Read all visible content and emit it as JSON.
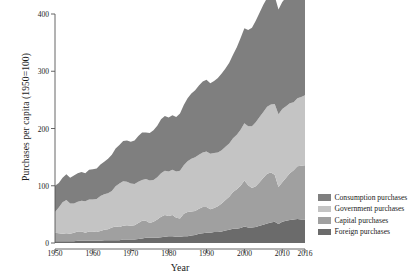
{
  "chart_data": {
    "type": "area",
    "stacked": true,
    "title": "",
    "xlabel": "Year",
    "ylabel": "Purchases per capita (1950=100)",
    "xlim": [
      1950,
      2016
    ],
    "ylim": [
      0,
      400
    ],
    "xticks": [
      1950,
      1960,
      1970,
      1980,
      1990,
      2000,
      2010,
      2016
    ],
    "yticks": [
      0,
      100,
      200,
      300,
      400
    ],
    "grid": false,
    "legend_position": "right",
    "colors": {
      "consumption": "#7f7f7f",
      "government": "#c4c4c4",
      "capital": "#a0a0a0",
      "foreign": "#6b6b6b",
      "axis": "#555555",
      "background": "#ffffff"
    },
    "x": [
      1950,
      1951,
      1952,
      1953,
      1954,
      1955,
      1956,
      1957,
      1958,
      1959,
      1960,
      1961,
      1962,
      1963,
      1964,
      1965,
      1966,
      1967,
      1968,
      1969,
      1970,
      1971,
      1972,
      1973,
      1974,
      1975,
      1976,
      1977,
      1978,
      1979,
      1980,
      1981,
      1982,
      1983,
      1984,
      1985,
      1986,
      1987,
      1988,
      1989,
      1990,
      1991,
      1992,
      1993,
      1994,
      1995,
      1996,
      1997,
      1998,
      1999,
      2000,
      2001,
      2002,
      2003,
      2004,
      2005,
      2006,
      2007,
      2008,
      2009,
      2010,
      2011,
      2012,
      2013,
      2014,
      2015,
      2016
    ],
    "series": [
      {
        "name": "Foreign purchases",
        "key": "foreign",
        "color": "#6b6b6b",
        "values": [
          3,
          3,
          3,
          3,
          3,
          3,
          4,
          4,
          4,
          4,
          4,
          4,
          4,
          5,
          5,
          5,
          5,
          5,
          6,
          6,
          6,
          6,
          7,
          8,
          9,
          9,
          9,
          9,
          10,
          11,
          12,
          12,
          11,
          11,
          12,
          12,
          13,
          14,
          16,
          17,
          18,
          18,
          19,
          19,
          20,
          22,
          23,
          25,
          25,
          26,
          29,
          27,
          27,
          28,
          30,
          32,
          34,
          36,
          37,
          33,
          37,
          39,
          40,
          41,
          42,
          41,
          41
        ]
      },
      {
        "name": "Capital purchases",
        "key": "capital",
        "color": "#a0a0a0",
        "values": [
          15,
          14,
          13,
          14,
          13,
          15,
          16,
          16,
          14,
          16,
          16,
          15,
          17,
          18,
          19,
          22,
          24,
          23,
          24,
          25,
          24,
          25,
          28,
          31,
          30,
          26,
          28,
          32,
          36,
          38,
          35,
          37,
          33,
          32,
          39,
          42,
          42,
          42,
          44,
          46,
          45,
          41,
          42,
          45,
          49,
          53,
          58,
          64,
          69,
          74,
          80,
          74,
          69,
          71,
          76,
          82,
          87,
          87,
          82,
          65,
          69,
          75,
          82,
          86,
          92,
          94,
          95
        ]
      },
      {
        "name": "Government purchases",
        "key": "government",
        "color": "#c4c4c4",
        "values": [
          36,
          45,
          55,
          58,
          53,
          51,
          52,
          54,
          55,
          56,
          56,
          58,
          61,
          62,
          63,
          64,
          70,
          76,
          78,
          76,
          74,
          72,
          72,
          71,
          73,
          74,
          73,
          74,
          76,
          77,
          78,
          79,
          81,
          83,
          85,
          89,
          92,
          94,
          94,
          95,
          97,
          97,
          96,
          94,
          93,
          93,
          93,
          94,
          95,
          98,
          100,
          103,
          108,
          112,
          114,
          115,
          117,
          119,
          124,
          127,
          128,
          125,
          122,
          119,
          119,
          120,
          122
        ]
      },
      {
        "name": "Consumption purchases",
        "key": "consumption",
        "color": "#7f7f7f",
        "values": [
          46,
          43,
          43,
          45,
          45,
          49,
          50,
          50,
          49,
          52,
          53,
          53,
          55,
          57,
          60,
          63,
          66,
          67,
          70,
          72,
          73,
          76,
          80,
          83,
          81,
          83,
          87,
          90,
          94,
          96,
          94,
          95,
          95,
          100,
          105,
          110,
          114,
          117,
          121,
          124,
          125,
          123,
          126,
          130,
          134,
          137,
          141,
          146,
          153,
          160,
          166,
          168,
          172,
          177,
          182,
          187,
          190,
          192,
          188,
          183,
          187,
          190,
          194,
          198,
          204,
          211,
          215
        ]
      }
    ],
    "totals_note": "Stacked total rises from about 100 in 1950 to about 410 in 2016"
  },
  "legend": {
    "items": [
      {
        "label": "Consumption purchases",
        "color": "#7f7f7f"
      },
      {
        "label": "Government purchases",
        "color": "#c4c4c4"
      },
      {
        "label": "Capital purchases",
        "color": "#a0a0a0"
      },
      {
        "label": "Foreign purchases",
        "color": "#6b6b6b"
      }
    ]
  }
}
